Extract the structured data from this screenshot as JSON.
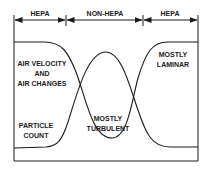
{
  "diagram": {
    "zones": [
      {
        "label": "HEPA"
      },
      {
        "label": "NON-HEPA"
      },
      {
        "label": "HEPA"
      }
    ],
    "labels": {
      "air_velocity_line1": "AIR VELOCITY",
      "air_velocity_line2": "AND",
      "air_velocity_line3": "AIR CHANGES",
      "particle_line1": "PARTICLE",
      "particle_line2": "COUNT",
      "turbulent_line1": "MOSTLY",
      "turbulent_line2": "TURBULENT",
      "laminar_line1": "MOSTLY",
      "laminar_line2": "LAMINAR"
    },
    "colors": {
      "line": "#1a1a1a",
      "background": "#ffffff"
    }
  }
}
